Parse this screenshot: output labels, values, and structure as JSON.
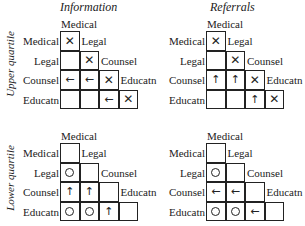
{
  "columns": {
    "information": "Information",
    "referrals": "Referrals"
  },
  "rows": {
    "upper": "Upper quartile",
    "lower": "Lower quartile"
  },
  "categories": [
    "Medical",
    "Legal",
    "Counsel",
    "Educatn"
  ],
  "panels": [
    {
      "id": "upper-information",
      "cells": [
        [
          "x"
        ],
        [
          "",
          "x"
        ],
        [
          "←",
          "←",
          "x"
        ],
        [
          "",
          "",
          "←",
          "x"
        ]
      ]
    },
    {
      "id": "upper-referrals",
      "cells": [
        [
          "x"
        ],
        [
          "",
          "x"
        ],
        [
          "↑",
          "↑",
          "x"
        ],
        [
          "",
          "",
          "↑",
          "x"
        ]
      ]
    },
    {
      "id": "lower-information",
      "cells": [
        [
          ""
        ],
        [
          "o",
          ""
        ],
        [
          "↑",
          "↑",
          ""
        ],
        [
          "o",
          "o",
          "↑",
          ""
        ]
      ]
    },
    {
      "id": "lower-referrals",
      "cells": [
        [
          ""
        ],
        [
          "o",
          ""
        ],
        [
          "←",
          "←",
          ""
        ],
        [
          "o",
          "o",
          "←",
          ""
        ]
      ]
    }
  ]
}
